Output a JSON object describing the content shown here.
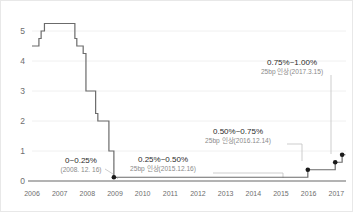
{
  "chart_data": {
    "type": "line",
    "title": "",
    "xlabel": "",
    "ylabel": "",
    "ylim": [
      0,
      5.6
    ],
    "xlim": [
      2006,
      2017.35
    ],
    "grid": true,
    "legend": "none",
    "y_ticks": [
      "0",
      "1",
      "2",
      "3",
      "4",
      "5"
    ],
    "y_tick_values": [
      0,
      1,
      2,
      3,
      4,
      5
    ],
    "x_ticks": [
      "2006",
      "2007",
      "2008",
      "2009",
      "2010",
      "2011",
      "2012",
      "2013",
      "2014",
      "2015",
      "2016",
      "2017"
    ],
    "x_tick_values": [
      2006,
      2007,
      2008,
      2009,
      2010,
      2011,
      2012,
      2013,
      2014,
      2015,
      2016,
      2017
    ],
    "series": [
      {
        "name": "Federal Funds Rate",
        "step": "post",
        "points": [
          {
            "x": 2006.0,
            "y": 4.5
          },
          {
            "x": 2006.08,
            "y": 4.5
          },
          {
            "x": 2006.25,
            "y": 4.75
          },
          {
            "x": 2006.33,
            "y": 5.0
          },
          {
            "x": 2006.45,
            "y": 5.25
          },
          {
            "x": 2007.5,
            "y": 5.25
          },
          {
            "x": 2007.55,
            "y": 4.75
          },
          {
            "x": 2007.62,
            "y": 4.5
          },
          {
            "x": 2007.85,
            "y": 4.25
          },
          {
            "x": 2007.95,
            "y": 3.0
          },
          {
            "x": 2008.2,
            "y": 3.0
          },
          {
            "x": 2008.3,
            "y": 2.25
          },
          {
            "x": 2008.38,
            "y": 2.0
          },
          {
            "x": 2008.72,
            "y": 2.0
          },
          {
            "x": 2008.78,
            "y": 1.0
          },
          {
            "x": 2008.9,
            "y": 1.0
          },
          {
            "x": 2008.96,
            "y": 0.125
          },
          {
            "x": 2015.96,
            "y": 0.125
          },
          {
            "x": 2015.97,
            "y": 0.375
          },
          {
            "x": 2016.95,
            "y": 0.375
          },
          {
            "x": 2016.96,
            "y": 0.625
          },
          {
            "x": 2017.2,
            "y": 0.625
          },
          {
            "x": 2017.21,
            "y": 0.875
          },
          {
            "x": 2017.33,
            "y": 0.875
          }
        ]
      }
    ],
    "markers": [
      {
        "x": 2008.96,
        "y": 0.125,
        "label": "2008.12.16"
      },
      {
        "x": 2015.97,
        "y": 0.375,
        "label": "2015.12.16"
      },
      {
        "x": 2016.96,
        "y": 0.625,
        "label": "2016.12.14"
      },
      {
        "x": 2017.21,
        "y": 0.875,
        "label": "2017.3.15"
      }
    ],
    "annotations": [
      {
        "id": "ann-2008",
        "title": "0~0.25%",
        "subtitle": "(2008. 12. 16)",
        "target_x": 2008.96,
        "target_y": 0.125
      },
      {
        "id": "ann-2015",
        "title": "0.25%~0.50%",
        "subtitle": "25bp 인상(2015.12.16)",
        "target_x": 2015.97,
        "target_y": 0.375
      },
      {
        "id": "ann-2016",
        "title": "0.50%~0.75%",
        "subtitle": "25bp 인상(2016.12.14)",
        "target_x": 2016.96,
        "target_y": 0.625
      },
      {
        "id": "ann-2017",
        "title": "0.75%~1.00%",
        "subtitle": "25bp 인상(2017.3.15)",
        "target_x": 2017.21,
        "target_y": 0.875
      }
    ],
    "colors": {
      "line": "#6b6b6b",
      "marker": "#1a1a1a",
      "grid": "#f0f0f0",
      "axis": "#9a9a9a",
      "tick_text": "#6e6e6e",
      "annotation_title": "#2a2a2a",
      "annotation_subtitle": "#8a8a8a",
      "leader": "#c0c0c0",
      "background": "#ffffff"
    }
  }
}
